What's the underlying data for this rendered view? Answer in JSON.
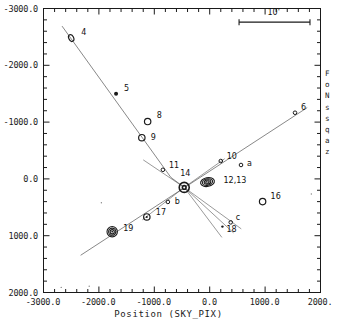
{
  "figure": {
    "type": "scatter",
    "xlabel": "Position (SKY_PIX)",
    "right_margin_text": [
      "F",
      "o",
      "N",
      "s",
      "s",
      "q",
      "a",
      "z"
    ],
    "scalebar_label": "10'"
  },
  "chart_data": {
    "type": "scatter",
    "title": "",
    "xlabel": "Position (SKY_PIX)",
    "ylabel": "",
    "xlim": [
      -3000.0,
      2000.0
    ],
    "ylim": [
      -3000.0,
      2000.0
    ],
    "y_inverted": true,
    "grid": false,
    "legend": null,
    "xticklabels": [
      "-3000.0",
      "-2000.0",
      "-1000.0",
      "0.0",
      "1000.0",
      "2000."
    ],
    "xtickvalues": [
      -3000,
      -2000,
      -1000,
      0,
      1000,
      2000
    ],
    "yticklabels": [
      "-3000.0",
      "-2000.0",
      "-1000.0",
      "0.0",
      "1000.0",
      "2000.0"
    ],
    "ytickvalues": [
      -3000,
      -2000,
      -1000,
      0,
      1000,
      2000
    ],
    "minor_ticks_per_interval": 5,
    "scalebar": {
      "label": "10'",
      "x_start": 530,
      "x_end": 1810,
      "y": -2760
    },
    "points": [
      {
        "label": "4",
        "x": -2500,
        "y": -2480,
        "marker": "open-ellipse-small",
        "lx": 10,
        "ly": -6
      },
      {
        "label": "5",
        "x": -1690,
        "y": -1500,
        "marker": "filled-dot",
        "lx": 8,
        "ly": -6
      },
      {
        "label": "8",
        "x": -1120,
        "y": -1010,
        "marker": "open-circle",
        "lx": 9,
        "ly": -7
      },
      {
        "label": "9",
        "x": -1225,
        "y": -725,
        "marker": "open-circle",
        "lx": 9,
        "ly": -1
      },
      {
        "label": "6",
        "x": 1540,
        "y": -1165,
        "marker": "tiny-circle",
        "lx": 6,
        "ly": -6
      },
      {
        "label": "11",
        "x": -845,
        "y": -160,
        "marker": "tiny-circle",
        "lx": 6,
        "ly": -5
      },
      {
        "label": "10",
        "x": 200,
        "y": -315,
        "marker": "tiny-circle",
        "lx": 6,
        "ly": -5
      },
      {
        "label": "a",
        "x": 565,
        "y": -245,
        "marker": "tiny-circle",
        "lx": 6,
        "ly": -2
      },
      {
        "label": "14",
        "x": -460,
        "y": 150,
        "marker": "target",
        "lx": -4,
        "ly": -14
      },
      {
        "label": "12,13",
        "x": -40,
        "y": 55,
        "marker": "contour-ellipse",
        "lx": 16,
        "ly": -2
      },
      {
        "label": "16",
        "x": 955,
        "y": 400,
        "marker": "open-circle",
        "lx": 8,
        "ly": -6
      },
      {
        "label": "b",
        "x": -755,
        "y": 405,
        "marker": "tiny-circle",
        "lx": 7,
        "ly": -1
      },
      {
        "label": "17",
        "x": -1135,
        "y": 670,
        "marker": "open-circle-dot",
        "lx": 9,
        "ly": -5
      },
      {
        "label": "18",
        "x": 230,
        "y": 840,
        "marker": "tiny-dot",
        "lx": 4,
        "ly": 2
      },
      {
        "label": "c",
        "x": 380,
        "y": 765,
        "marker": "tiny-circle",
        "lx": 5,
        "ly": -5
      },
      {
        "label": "19",
        "x": -1760,
        "y": 930,
        "marker": "contour-circle",
        "lx": 11,
        "ly": -4
      }
    ],
    "streaks": [
      {
        "name": "nw-se-streak",
        "x1": -2665,
        "y1": -2690,
        "x2": -700,
        "y2": -25
      },
      {
        "name": "sw-ne-streak",
        "x1": -2330,
        "y1": 1345,
        "x2": 1760,
        "y2": -1255
      }
    ],
    "rays": [
      {
        "name": "ray-up-left",
        "x1": -460,
        "y1": 150,
        "x2": -1200,
        "y2": -335
      },
      {
        "name": "ray-up-right",
        "x1": -460,
        "y1": 150,
        "x2": 270,
        "y2": -355
      },
      {
        "name": "ray-down-left",
        "x1": -460,
        "y1": 150,
        "x2": -1215,
        "y2": 720
      },
      {
        "name": "ray-down-right",
        "x1": -460,
        "y1": 150,
        "x2": 570,
        "y2": 880
      },
      {
        "name": "ray-down-mid",
        "x1": -460,
        "y1": 150,
        "x2": 220,
        "y2": 1030
      },
      {
        "name": "ray-down-far",
        "x1": -460,
        "y1": 150,
        "x2": 430,
        "y2": 950
      }
    ],
    "speckles": [
      {
        "x": -1955,
        "y": 420
      },
      {
        "x": 1835,
        "y": 265
      },
      {
        "x": -2680,
        "y": 1910
      },
      {
        "x": -2175,
        "y": 1890
      }
    ]
  }
}
